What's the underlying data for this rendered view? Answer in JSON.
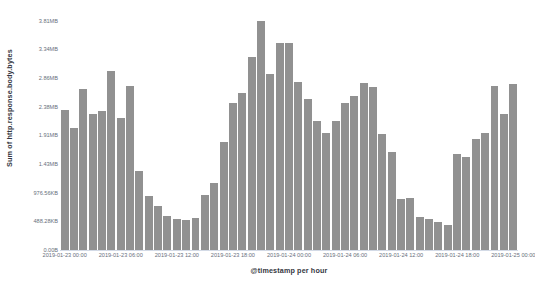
{
  "chart_data": {
    "type": "bar",
    "title": "",
    "subtitle": "",
    "xlabel": "@timestamp per hour",
    "ylabel": "Sum of http.response.body.bytes",
    "grid": false,
    "legend": null,
    "bar_color": "#919191",
    "axis_label_color": "#69707d",
    "axis_title_color": "#343741",
    "ylim": [
      0,
      4.0531
    ],
    "y_unit": "bytes",
    "y_tick_labels": [
      "0.00B",
      "488.28KB",
      "976.56KB",
      "1.43MB",
      "1.91MB",
      "2.38MB",
      "2.86MB",
      "3.34MB",
      "3.81MB"
    ],
    "y_tick_values": [
      0,
      0.4768,
      0.9536,
      1.43,
      1.91,
      2.38,
      2.86,
      3.34,
      3.81
    ],
    "x_tick_labels": [
      "2019-01-23 00:00",
      "2019-01-23 06:00",
      "2019-01-23 12:00",
      "2019-01-23 18:00",
      "2019-01-24 00:00",
      "2019-01-24 06:00",
      "2019-01-24 12:00",
      "2019-01-24 18:00",
      "2019-01-25 00:00"
    ],
    "x_tick_positions": [
      0,
      6,
      12,
      18,
      24,
      30,
      36,
      42,
      48
    ],
    "categories": [
      "2019-01-23 00:00",
      "2019-01-23 01:00",
      "2019-01-23 02:00",
      "2019-01-23 03:00",
      "2019-01-23 04:00",
      "2019-01-23 05:00",
      "2019-01-23 06:00",
      "2019-01-23 07:00",
      "2019-01-23 08:00",
      "2019-01-23 09:00",
      "2019-01-23 10:00",
      "2019-01-23 11:00",
      "2019-01-23 12:00",
      "2019-01-23 13:00",
      "2019-01-23 14:00",
      "2019-01-23 15:00",
      "2019-01-23 16:00",
      "2019-01-23 17:00",
      "2019-01-23 18:00",
      "2019-01-23 19:00",
      "2019-01-23 20:00",
      "2019-01-23 21:00",
      "2019-01-23 22:00",
      "2019-01-23 23:00",
      "2019-01-24 00:00",
      "2019-01-24 01:00",
      "2019-01-24 02:00",
      "2019-01-24 03:00",
      "2019-01-24 04:00",
      "2019-01-24 05:00",
      "2019-01-24 06:00",
      "2019-01-24 07:00",
      "2019-01-24 08:00",
      "2019-01-24 09:00",
      "2019-01-24 10:00",
      "2019-01-24 11:00",
      "2019-01-24 12:00",
      "2019-01-24 13:00",
      "2019-01-24 14:00",
      "2019-01-24 15:00",
      "2019-01-24 16:00",
      "2019-01-24 17:00",
      "2019-01-24 18:00",
      "2019-01-24 19:00",
      "2019-01-24 20:00",
      "2019-01-24 21:00",
      "2019-01-24 22:00",
      "2019-01-24 23:00",
      "2019-01-25 00:00"
    ],
    "values": [
      2.32,
      2.03,
      2.67,
      2.26,
      2.31,
      2.98,
      2.2,
      2.72,
      1.32,
      0.9,
      0.73,
      0.57,
      0.52,
      0.5,
      0.54,
      0.92,
      1.11,
      1.79,
      2.45,
      2.6,
      3.2,
      3.81,
      2.92,
      3.44,
      3.44,
      2.79,
      2.51,
      2.15,
      1.94,
      2.15,
      2.45,
      2.56,
      2.77,
      2.7,
      1.93,
      1.62,
      0.84,
      0.86,
      0.55,
      0.51,
      0.47,
      0.42,
      1.6,
      1.54,
      1.85,
      1.95,
      2.72,
      2.26,
      2.75
    ],
    "series": [
      {
        "name": "Sum of http.response.body.bytes",
        "values": [
          2.32,
          2.03,
          2.67,
          2.26,
          2.31,
          2.98,
          2.2,
          2.72,
          1.32,
          0.9,
          0.73,
          0.57,
          0.52,
          0.5,
          0.54,
          0.92,
          1.11,
          1.79,
          2.45,
          2.6,
          3.2,
          3.81,
          2.92,
          3.44,
          3.44,
          2.79,
          2.51,
          2.15,
          1.94,
          2.15,
          2.45,
          2.56,
          2.77,
          2.7,
          1.93,
          1.62,
          0.84,
          0.86,
          0.55,
          0.51,
          0.47,
          0.42,
          1.6,
          1.54,
          1.85,
          1.95,
          2.72,
          2.26,
          2.75
        ]
      }
    ]
  }
}
